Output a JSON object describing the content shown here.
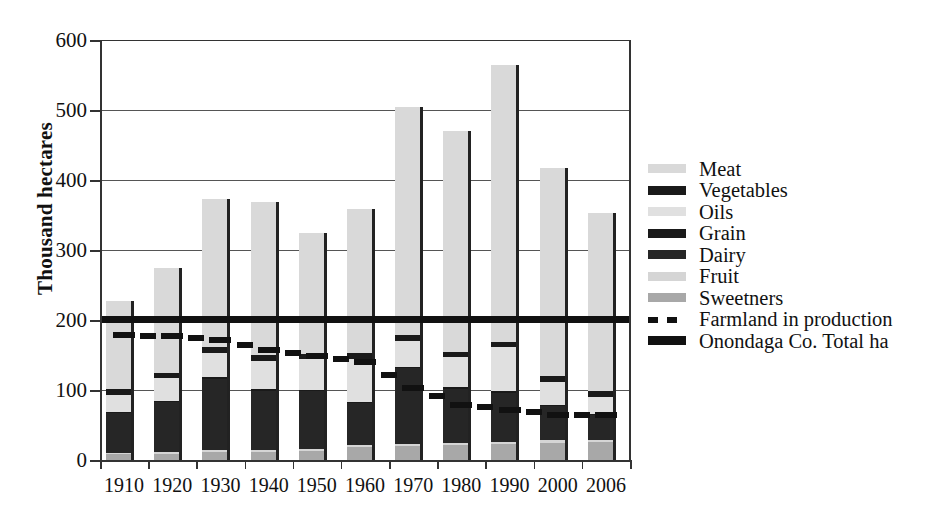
{
  "chart": {
    "type": "bar",
    "ylabel": "Thousand hectares",
    "xlabel": "",
    "title": ""
  },
  "axis": {
    "y_ticks": [
      "0",
      "100",
      "200",
      "300",
      "400",
      "500",
      "600"
    ],
    "y_min": 0,
    "y_max": 600,
    "x_ticks": [
      "1910",
      "1920",
      "1930",
      "1940",
      "1950",
      "1960",
      "1970",
      "1980",
      "1990",
      "2000",
      "2006"
    ]
  },
  "colors": {
    "meat": "#d9d9d9",
    "vegetables": "#1a1a1a",
    "oils": "#e0e0e0",
    "grain": "#1a1a1a",
    "dairy": "#262626",
    "fruit": "#d5d5d5",
    "sweetners": "#a8a8a8",
    "farmland": "#111111",
    "total": "#111111",
    "grid": "#555555",
    "axis": "#333333"
  },
  "legend": {
    "position": "right",
    "items": [
      {
        "label": "Meat",
        "swatch": "meat",
        "style": "block"
      },
      {
        "label": "Vegetables",
        "swatch": "vegetables",
        "style": "block"
      },
      {
        "label": "Oils",
        "swatch": "oils",
        "style": "block"
      },
      {
        "label": "Grain",
        "swatch": "grain",
        "style": "block"
      },
      {
        "label": "Dairy",
        "swatch": "dairy",
        "style": "block"
      },
      {
        "label": "Fruit",
        "swatch": "fruit",
        "style": "block"
      },
      {
        "label": "Sweetners",
        "swatch": "sweetners",
        "style": "block"
      },
      {
        "label": "Farmland in production",
        "swatch": "farmland",
        "style": "dashed"
      },
      {
        "label": "Onondaga Co. Total ha",
        "swatch": "total",
        "style": "line"
      }
    ]
  },
  "chart_data": {
    "type": "bar",
    "title": "",
    "xlabel": "",
    "ylabel": "Thousand hectares",
    "ylim": [
      0,
      600
    ],
    "grid": true,
    "legend_position": "right",
    "stacked": true,
    "categories": [
      "1910",
      "1920",
      "1930",
      "1940",
      "1950",
      "1960",
      "1970",
      "1980",
      "1990",
      "2000",
      "2006"
    ],
    "series": [
      {
        "name": "Sweetners",
        "values": [
          8,
          9,
          11,
          12,
          13,
          18,
          20,
          22,
          23,
          25,
          26
        ]
      },
      {
        "name": "Fruit",
        "values": [
          2,
          2,
          3,
          3,
          3,
          3,
          3,
          3,
          3,
          3,
          3
        ]
      },
      {
        "name": "Dairy",
        "values": [
          57,
          72,
          102,
          84,
          82,
          60,
          108,
          77,
          70,
          49,
          35
        ]
      },
      {
        "name": "Grain",
        "values": [
          2,
          2,
          2,
          2,
          2,
          2,
          2,
          2,
          2,
          2,
          2
        ]
      },
      {
        "name": "Oils",
        "values": [
          24,
          32,
          35,
          41,
          44,
          62,
          37,
          43,
          63,
          33,
          24
        ]
      },
      {
        "name": "Vegetables",
        "values": [
          8,
          8,
          8,
          8,
          8,
          8,
          8,
          8,
          8,
          8,
          8
        ]
      },
      {
        "name": "Meat",
        "values": [
          126,
          150,
          212,
          218,
          173,
          206,
          327,
          315,
          396,
          297,
          255
        ]
      }
    ],
    "totals": [
      227,
      275,
      373,
      368,
      325,
      359,
      505,
      470,
      565,
      417,
      353
    ],
    "overlays": [
      {
        "name": "Farmland in production",
        "type": "line",
        "style": "dashed",
        "x": [
          "1910",
          "1920",
          "1930",
          "1940",
          "1950",
          "1960",
          "1970",
          "1980",
          "1990",
          "2000",
          "2006"
        ],
        "values": [
          178,
          177,
          172,
          157,
          148,
          140,
          103,
          79,
          72,
          65,
          64
        ]
      },
      {
        "name": "Onondaga Co. Total ha",
        "type": "line",
        "style": "solid",
        "constant": 202,
        "x": [
          "1910",
          "1920",
          "1930",
          "1940",
          "1950",
          "1960",
          "1970",
          "1980",
          "1990",
          "2000",
          "2006"
        ],
        "values": [
          202,
          202,
          202,
          202,
          202,
          202,
          202,
          202,
          202,
          202,
          202
        ]
      }
    ]
  }
}
